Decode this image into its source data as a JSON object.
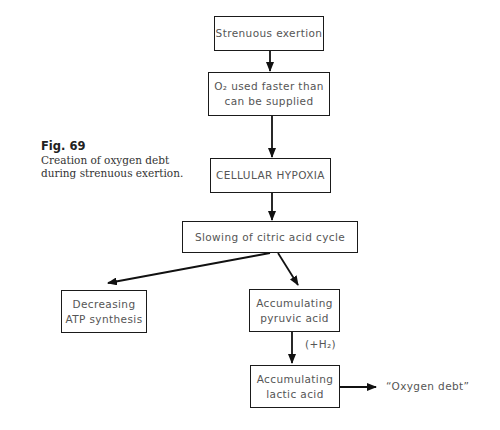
{
  "figure": {
    "number_label": "Fig. 69",
    "caption_line1": "Creation of oxygen debt",
    "caption_line2": "during strenuous exertion."
  },
  "nodes": {
    "strenuous_exertion": {
      "lines": [
        "Strenuous exertion"
      ]
    },
    "o2_used_faster": {
      "lines": [
        "O₂ used faster than",
        "can be supplied"
      ]
    },
    "cellular_hypoxia": {
      "lines": [
        "CELLULAR HYPOXIA"
      ]
    },
    "slowing_citric": {
      "lines": [
        "Slowing of citric acid cycle"
      ]
    },
    "decreasing_atp": {
      "lines": [
        "Decreasing",
        "ATP synthesis"
      ]
    },
    "accum_pyruvic": {
      "lines": [
        "Accumulating",
        "pyruvic acid"
      ]
    },
    "accum_lactic": {
      "lines": [
        "Accumulating",
        "lactic acid"
      ]
    }
  },
  "edge_labels": {
    "plus_h2": "(+H₂)",
    "oxygen_debt": "“Oxygen debt”"
  },
  "edges": [
    {
      "from": "Strenuous exertion",
      "to": "O₂ used faster than can be supplied"
    },
    {
      "from": "O₂ used faster than can be supplied",
      "to": "CELLULAR HYPOXIA"
    },
    {
      "from": "CELLULAR HYPOXIA",
      "to": "Slowing of citric acid cycle"
    },
    {
      "from": "Slowing of citric acid cycle",
      "to": "Decreasing ATP synthesis"
    },
    {
      "from": "Slowing of citric acid cycle",
      "to": "Accumulating pyruvic acid"
    },
    {
      "from": "Accumulating pyruvic acid",
      "to": "Accumulating lactic acid",
      "label": "(+H₂)"
    },
    {
      "from": "Accumulating lactic acid",
      "to": "“Oxygen debt”"
    }
  ]
}
